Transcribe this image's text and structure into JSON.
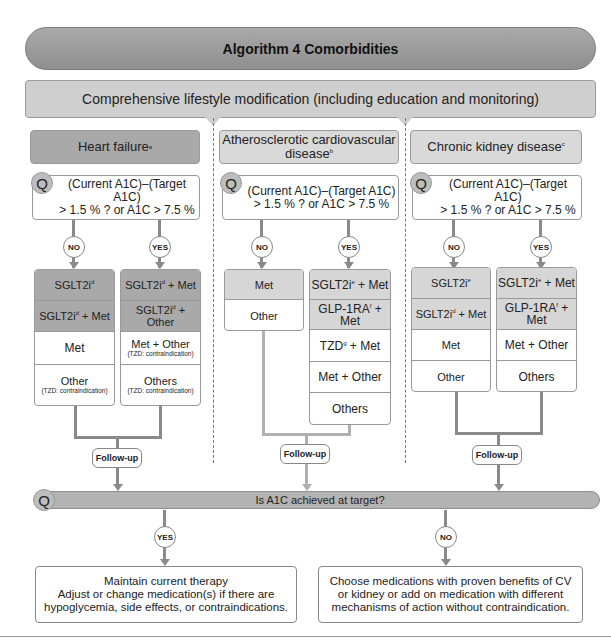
{
  "title": "Algorithm 4 Comorbidities",
  "lifestyle": "Comprehensive lifestyle modification (including education and monitoring)",
  "question_glyph": "Q",
  "columns": [
    {
      "title": "Heart failure",
      "title_sup": "a",
      "question_line1": "(Current A1C)–(Target A1C)",
      "question_line2": "> 1.5 % ? or A1C > 7.5 %",
      "no_label": "NO",
      "yes_label": "YES",
      "no_options": [
        {
          "text": "SGLT2i",
          "sup": "d",
          "suffix": "",
          "note": ""
        },
        {
          "text": "SGLT2i",
          "sup": "d",
          "suffix": " + Met",
          "note": ""
        },
        {
          "text": "Met",
          "sup": "",
          "suffix": "",
          "note": ""
        },
        {
          "text": "Other",
          "sup": "",
          "suffix": "",
          "note": "(TZD: contraindication)"
        }
      ],
      "yes_options": [
        {
          "text": "SGLT2i",
          "sup": "d",
          "suffix": " + Met",
          "note": ""
        },
        {
          "text": "SGLT2i",
          "sup": "d",
          "suffix": " + Other",
          "note": ""
        },
        {
          "text": "Met + Other",
          "sup": "",
          "suffix": "",
          "note": "(TZD: contraindication)"
        },
        {
          "text": "Others",
          "sup": "",
          "suffix": "",
          "note": "(TZD: contraindication)"
        }
      ],
      "followup": "Follow-up"
    },
    {
      "title": "Atherosclerotic cardiovascular disease",
      "title_sup": "b",
      "question_line1": "(Current A1C)–(Target A1C)",
      "question_line2": "> 1.5 % ? or A1C > 7.5 %",
      "no_label": "NO",
      "yes_label": "YES",
      "no_options": [
        {
          "text": "Met",
          "sup": "",
          "suffix": "",
          "note": ""
        },
        {
          "text": "Other",
          "sup": "",
          "suffix": "",
          "note": ""
        }
      ],
      "yes_options": [
        {
          "text": "SGLT2i",
          "sup": "e",
          "suffix": " + Met",
          "note": ""
        },
        {
          "text": "GLP-1RA",
          "sup": "f",
          "suffix": " + Met",
          "note": ""
        },
        {
          "text": "TZD",
          "sup": "g",
          "suffix": " + Met",
          "note": ""
        },
        {
          "text": "Met + Other",
          "sup": "",
          "suffix": "",
          "note": ""
        },
        {
          "text": "Others",
          "sup": "",
          "suffix": "",
          "note": ""
        }
      ],
      "followup": "Follow-up"
    },
    {
      "title": "Chronic kidney disease",
      "title_sup": "c",
      "question_line1": "(Current A1C)–(Target A1C)",
      "question_line2": "> 1.5 % ? or A1C > 7.5 %",
      "no_label": "NO",
      "yes_label": "YES",
      "no_options": [
        {
          "text": "SGLT2i",
          "sup": "e",
          "suffix": "",
          "note": ""
        },
        {
          "text": "SGLT2i",
          "sup": "d",
          "suffix": " + Met",
          "note": ""
        },
        {
          "text": "Met",
          "sup": "",
          "suffix": "",
          "note": ""
        },
        {
          "text": "Other",
          "sup": "",
          "suffix": "",
          "note": ""
        }
      ],
      "yes_options": [
        {
          "text": "SGLT2i",
          "sup": "e",
          "suffix": " + Met",
          "note": ""
        },
        {
          "text": "GLP-1RA",
          "sup": "f",
          "suffix": " + Met",
          "note": ""
        },
        {
          "text": "Met + Other",
          "sup": "",
          "suffix": "",
          "note": ""
        },
        {
          "text": "Others",
          "sup": "",
          "suffix": "",
          "note": ""
        }
      ],
      "followup": "Follow-up"
    }
  ],
  "final_question": "Is A1C achieved at target?",
  "final_yes_label": "YES",
  "final_no_label": "NO",
  "yes_outcome": {
    "line1": "Maintain current therapy",
    "line2": "Adjust or change medication(s) if there are",
    "line3": "hypoglycemia, side effects, or contraindications."
  },
  "no_outcome": {
    "line1": "Choose medications with proven benefits of CV",
    "line2": "or kidney or add on medication with different",
    "line3": "mechanisms of action without contraindication."
  }
}
